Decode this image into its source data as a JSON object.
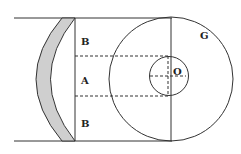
{
  "diagram": {
    "labels": {
      "upper_band": "B",
      "middle_band": "A",
      "lower_band": "B",
      "small_circle_center": "O",
      "large_circle": "G"
    },
    "colors": {
      "stroke": "#333333",
      "lens_fill": "#cfcfcf",
      "background": "#ffffff"
    }
  }
}
